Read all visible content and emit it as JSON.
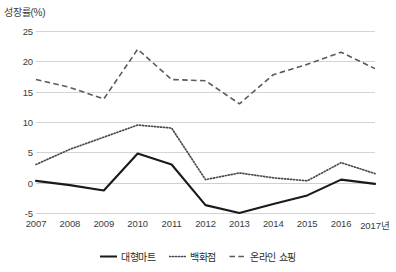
{
  "chart_data": {
    "type": "line",
    "title": "",
    "ylabel": "성장률(%)",
    "xlabel": "",
    "xaxis_unit_suffix": "년",
    "categories": [
      "2007",
      "2008",
      "2009",
      "2010",
      "2011",
      "2012",
      "2013",
      "2014",
      "2015",
      "2016",
      "2017"
    ],
    "xtick_labels": [
      "2007",
      "2008",
      "2009",
      "2010",
      "2011",
      "2012",
      "2013",
      "2014",
      "2015",
      "2016",
      "2017년"
    ],
    "ylim": [
      -5,
      25
    ],
    "yticks": [
      25,
      20,
      15,
      10,
      5,
      0,
      -5
    ],
    "ytick_labels": [
      "25",
      "20",
      "15",
      "10",
      "5",
      "0",
      "-5"
    ],
    "grid": true,
    "legend_position": "bottom-center",
    "series": [
      {
        "name": "대형마트",
        "style": "solid",
        "color": "#1a1a1a",
        "values": [
          0.3,
          -0.4,
          -1.3,
          4.8,
          3.0,
          -3.7,
          -5.0,
          -3.5,
          -2.1,
          0.5,
          -0.2
        ]
      },
      {
        "name": "백화점",
        "style": "dotted",
        "color": "#4a4a4a",
        "values": [
          3.0,
          5.5,
          7.5,
          9.5,
          9.0,
          0.5,
          1.6,
          0.8,
          0.3,
          3.3,
          1.5
        ]
      },
      {
        "name": "온라인 쇼핑",
        "style": "dashed",
        "color": "#5a5a5a",
        "values": [
          17.0,
          15.7,
          13.8,
          22.0,
          17.0,
          16.8,
          13.0,
          17.8,
          19.5,
          21.5,
          18.8
        ]
      }
    ]
  },
  "legend": {
    "items": [
      {
        "label": "대형마트",
        "style": "solid"
      },
      {
        "label": "백화점",
        "style": "dotted"
      },
      {
        "label": "온라인 쇼핑",
        "style": "dashed"
      }
    ]
  }
}
